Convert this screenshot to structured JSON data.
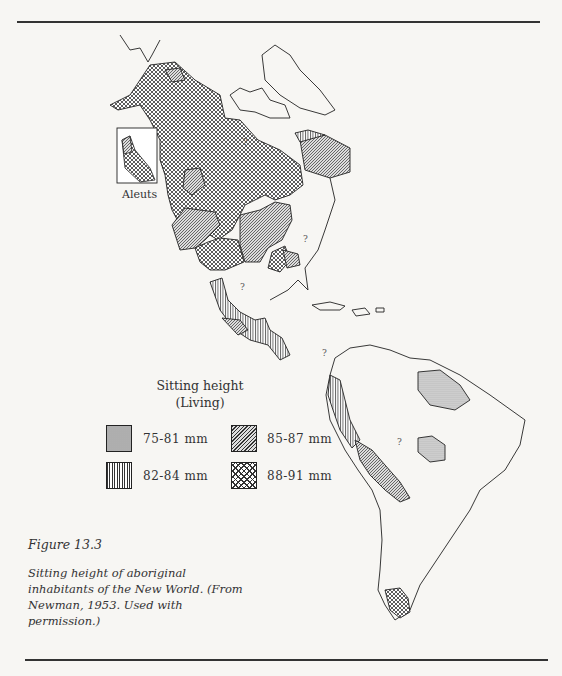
{
  "figure": {
    "label": "Figure 13.3",
    "caption": "Sitting height of aboriginal inhabitants of the New World. (From Newman, 1953. Used with permission.)"
  },
  "map": {
    "inset_label": "Aleuts",
    "unknown_marker": "?"
  },
  "legend": {
    "title": "Sitting height",
    "subtitle": "(Living)",
    "items": [
      {
        "label": "75-81 mm",
        "pattern": "fine-dot"
      },
      {
        "label": "82-84 mm",
        "pattern": "vertical-lines"
      },
      {
        "label": "85-87 mm",
        "pattern": "diagonal-lines"
      },
      {
        "label": "88-91 mm",
        "pattern": "crosshatch"
      }
    ]
  }
}
